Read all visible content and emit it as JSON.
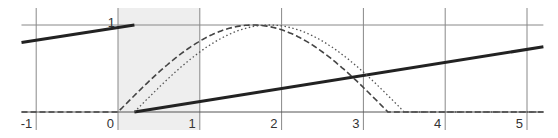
{
  "chart_data": {
    "type": "line",
    "title": "",
    "xlabel": "",
    "ylabel": "",
    "xlim": [
      -1.18,
      5.2
    ],
    "ylim": [
      0,
      1.2
    ],
    "grid": true,
    "x_ticks": [
      -1,
      0,
      1,
      2,
      3,
      4,
      5
    ],
    "x_tick_labels": [
      "-1",
      "0",
      "1",
      "2",
      "3",
      "4",
      "5"
    ],
    "y_ticks": [
      1
    ],
    "y_tick_labels": [
      "1"
    ],
    "shaded_region": {
      "x_from": 0,
      "x_to": 1,
      "color": "#eeeeee"
    },
    "series": [
      {
        "name": "solid-segment-left",
        "style": "solid",
        "color": "#222222",
        "x": [
          -1.18,
          0.2
        ],
        "y": [
          0.8,
          1.0
        ]
      },
      {
        "name": "solid-line",
        "style": "solid",
        "color": "#222222",
        "x": [
          0.2,
          5.2
        ],
        "y": [
          0.0,
          0.75
        ]
      },
      {
        "name": "dashed-curve",
        "style": "dashed",
        "color": "#444444",
        "x": [
          -1.18,
          0,
          0.5,
          1.0,
          1.65,
          2.0,
          2.5,
          3.0,
          3.3,
          5.2
        ],
        "y": [
          0,
          0,
          0.45,
          0.81,
          1.0,
          0.95,
          0.71,
          0.28,
          0,
          0
        ]
      },
      {
        "name": "dotted-curve",
        "style": "dotted",
        "color": "#555555",
        "x": [
          0.2,
          0.7,
          1.2,
          1.85,
          2.2,
          2.7,
          3.2,
          3.5,
          5.2
        ],
        "y": [
          0,
          0.45,
          0.81,
          1.0,
          0.95,
          0.71,
          0.28,
          0,
          0
        ]
      }
    ]
  }
}
